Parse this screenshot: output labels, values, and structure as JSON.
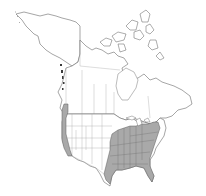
{
  "map": {
    "title": "North America range map",
    "region": "North America (Canada, United States, Mexico north)",
    "colors": {
      "background": "#ffffff",
      "land": "#ffffff",
      "outline": "#6a6a6a",
      "range_fill": "#a9a9a9"
    },
    "shaded_ranges": [
      {
        "name": "Eastern United States",
        "description": "Southeast US from east Texas to the Atlantic coast, north to the Ohio Valley and southern New England"
      },
      {
        "name": "Pacific Coast",
        "description": "Coastal strip from western Washington through Oregon to California"
      }
    ]
  }
}
